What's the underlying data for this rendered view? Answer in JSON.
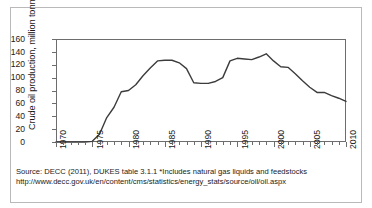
{
  "figure": {
    "source_line_1": "Source: DECC (2011), DUKES table 3.1.1 *Includes natural gas liquids and feedstocks",
    "source_line_2": "http://www.decc.gov.uk/en/content/cms/statistics/energy_stats/source/oil/oil.aspx"
  },
  "chart_data": {
    "type": "line",
    "title": "",
    "xlabel": "",
    "ylabel": "Crude oil production, million tonnes",
    "xlim": [
      1970,
      2010
    ],
    "ylim": [
      0,
      160
    ],
    "ytick_step": 20,
    "xtick_major_step": 5,
    "xtick_minor_step": 1,
    "grid": false,
    "legend": false,
    "line_color": "#3c3c3c",
    "x_tick_labels": [
      "1970",
      "1975",
      "1980",
      "1985",
      "1990",
      "1995",
      "2000",
      "2005",
      "2010"
    ],
    "y_tick_labels": [
      "0",
      "20",
      "40",
      "60",
      "80",
      "100",
      "120",
      "140",
      "160"
    ],
    "x": [
      1970,
      1971,
      1972,
      1973,
      1974,
      1975,
      1976,
      1977,
      1978,
      1979,
      1980,
      1981,
      1982,
      1983,
      1984,
      1985,
      1986,
      1987,
      1988,
      1989,
      1990,
      1991,
      1992,
      1993,
      1994,
      1995,
      1996,
      1997,
      1998,
      1999,
      2000,
      2001,
      2002,
      2003,
      2004,
      2005,
      2006,
      2007,
      2008,
      2009,
      2010
    ],
    "values": [
      0,
      0,
      0,
      0,
      0,
      1,
      12,
      38,
      54,
      78,
      80,
      89,
      103,
      115,
      126,
      127,
      127,
      123,
      114,
      92,
      91,
      91,
      94,
      100,
      126,
      130,
      129,
      128,
      132,
      137,
      126,
      117,
      116,
      106,
      95,
      85,
      77,
      77,
      72,
      68,
      63
    ],
    "annotations": [
      {
        "label": "production begins",
        "x": 1975,
        "y": 1
      },
      {
        "label": "first peak",
        "x": 1985,
        "y": 127
      },
      {
        "label": "trough",
        "x": 1990,
        "y": 91
      },
      {
        "label": "second peak",
        "x": 1999,
        "y": 137
      },
      {
        "label": "latest",
        "x": 2010,
        "y": 63
      }
    ]
  }
}
